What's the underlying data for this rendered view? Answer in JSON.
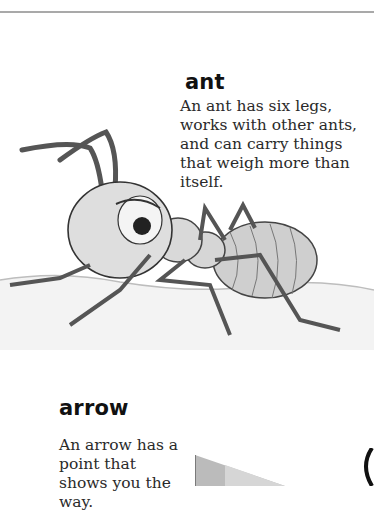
{
  "page": {
    "entries": [
      {
        "word": "ant",
        "definition": "An ant has six legs, works with other ants, and can carry things that weigh more than itself.",
        "illustration": "ant-illustration"
      },
      {
        "word": "arrow",
        "definition": "An arrow has a point that shows you the way.",
        "illustration": "arrow-illustration"
      }
    ]
  }
}
